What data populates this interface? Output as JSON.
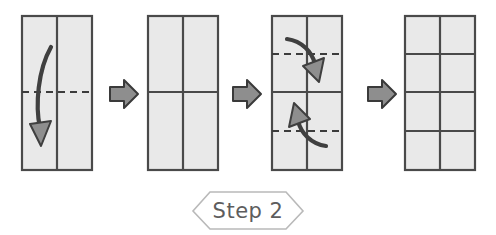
{
  "diagram": {
    "title": "Step 2",
    "type": "origami-fold-instructions",
    "colors": {
      "paper_fill": "#e9e9e9",
      "paper_edge": "#4a4a4a",
      "crease_line": "#3c3c3c",
      "arrow_fill": "#8e8e8e",
      "arrow_outline": "#3a3a3a",
      "banner_outline": "#b9b9b9",
      "banner_text": "#5d5d5d",
      "background": "#ffffff"
    },
    "panels": [
      {
        "index": 1,
        "name": "panel-1-fold-in-half-down",
        "label": "",
        "grid_columns": 2,
        "grid_rows": 1,
        "vertical_creases": [
          "center"
        ],
        "horizontal_solid_creases": [],
        "horizontal_dashed_creases": [
          "middle"
        ],
        "fold_arrows": [
          {
            "name": "fold-arrow-down",
            "direction": "down",
            "description": "curved arrow folding top half down over bottom half"
          }
        ]
      },
      {
        "index": 2,
        "name": "panel-2-half-folded",
        "label": "",
        "grid_columns": 2,
        "grid_rows": 2,
        "vertical_creases": [
          "center"
        ],
        "horizontal_solid_creases": [
          "middle"
        ],
        "horizontal_dashed_creases": [],
        "fold_arrows": []
      },
      {
        "index": 3,
        "name": "panel-3-fold-quarters",
        "label": "",
        "grid_columns": 2,
        "grid_rows": 2,
        "vertical_creases": [
          "center"
        ],
        "horizontal_solid_creases": [
          "middle"
        ],
        "horizontal_dashed_creases": [
          "one-quarter",
          "three-quarters"
        ],
        "fold_arrows": [
          {
            "name": "fold-arrow-down",
            "direction": "down",
            "description": "curved arrow folding top edge down to the middle crease"
          },
          {
            "name": "fold-arrow-up",
            "direction": "up",
            "description": "curved arrow folding bottom edge up to the middle crease"
          }
        ]
      },
      {
        "index": 4,
        "name": "panel-4-result-grid",
        "label": "",
        "grid_columns": 2,
        "grid_rows": 4,
        "vertical_creases": [
          "center"
        ],
        "horizontal_solid_creases": [
          "one-quarter",
          "middle",
          "three-quarters"
        ],
        "horizontal_dashed_creases": [],
        "fold_arrows": []
      }
    ],
    "step_arrows": [
      {
        "name": "step-arrow-1",
        "direction": "right"
      },
      {
        "name": "step-arrow-2",
        "direction": "right"
      },
      {
        "name": "step-arrow-3",
        "direction": "right"
      }
    ]
  }
}
